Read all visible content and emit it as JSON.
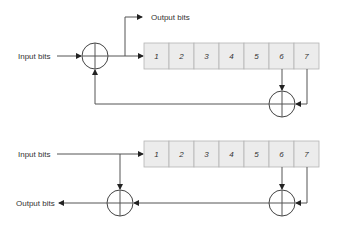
{
  "diagram": {
    "top": {
      "input_label": "Input bits",
      "output_label": "Output bits",
      "cells": [
        "1",
        "2",
        "3",
        "4",
        "5",
        "6",
        "7"
      ],
      "taps": [
        "6",
        "7"
      ]
    },
    "bottom": {
      "input_label": "Input bits",
      "output_label": "Output bits",
      "cells": [
        "1",
        "2",
        "3",
        "4",
        "5",
        "6",
        "7"
      ],
      "taps": [
        "6",
        "7"
      ]
    },
    "colors": {
      "cell_fill": "#ececec",
      "cell_border": "#b5b5b5",
      "line": "#555555"
    }
  }
}
